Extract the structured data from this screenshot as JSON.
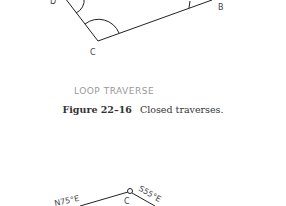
{
  "figure_top": {
    "points": {
      "D": "D",
      "C": "C",
      "B": "B"
    },
    "label": "LOOP TRAVERSE"
  },
  "caption": {
    "number": "Figure 22–16",
    "text": "Closed traverses."
  },
  "figure_bottom": {
    "point": "C",
    "bearings": [
      "N75°E",
      "S55°E"
    ]
  }
}
